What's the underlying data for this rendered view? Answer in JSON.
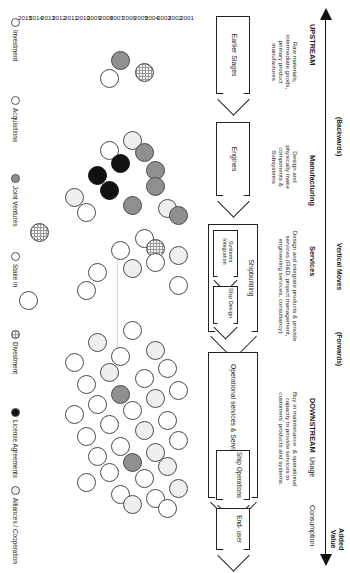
{
  "diagram": {
    "axis": {
      "left_end": "UPSTREAM",
      "left_direction": "(Backwards)",
      "right_end": "DOWNSTREAM",
      "right_direction": "(Forwards)",
      "center_label": "Vertical Moves",
      "added_value": "Added\nValue"
    },
    "stage_headers": [
      {
        "id": "manufacturing",
        "label": "Manufacturing"
      },
      {
        "id": "services",
        "label": "Services"
      },
      {
        "id": "usage",
        "label": "Usage"
      },
      {
        "id": "consumption",
        "label": "Consumption"
      }
    ],
    "descriptions": [
      {
        "id": "desc-upstream",
        "text": "Raw materials,\nintermediate goods,\nprimary product\nmanufactures"
      },
      {
        "id": "desc-manufacturing",
        "text": "Design and\nphysically make\ncomponents &\nSubsystems"
      },
      {
        "id": "desc-services",
        "text": "Design and integrate products & provide\nservices (R&D, project management,\nengineering services, consultancy)"
      },
      {
        "id": "desc-downstream",
        "text": "Buy in maintenance  & operational\ncapacity to provide services to\ncustomers' products and systems."
      }
    ],
    "chain_boxes": [
      {
        "id": "earlier-stages",
        "label": "Earlier Stages"
      },
      {
        "id": "engines",
        "label": "Engines"
      },
      {
        "id": "shipbuilding",
        "label": "Shipbuilding"
      },
      {
        "id": "systems-integration",
        "label": "Systems\nIntegration"
      },
      {
        "id": "ship-design",
        "label": "Ship\nDesign"
      },
      {
        "id": "operational-services",
        "label": "Operational services & Service provision"
      },
      {
        "id": "ship-operations",
        "label": "Ship\nOperations"
      },
      {
        "id": "end-user",
        "label": "End-\nuser"
      }
    ],
    "year_axis": {
      "label": "Year",
      "years": [
        "2001",
        "2002",
        "2003",
        "2004",
        "2005",
        "2006",
        "2007",
        "2008",
        "2009",
        "2010",
        "2011",
        "2012",
        "2013",
        "2014",
        "2015"
      ]
    },
    "legend": {
      "items": [
        {
          "id": "investment",
          "label": "Investment",
          "fill": "#ffffff",
          "style": "white"
        },
        {
          "id": "acquisitions",
          "label": "Acquisitions",
          "fill": "#ffffff",
          "style": "white"
        },
        {
          "id": "joint-ventures",
          "label": "Joint Ventures",
          "fill": "#8f8f8f",
          "style": "gray"
        },
        {
          "id": "stake-in",
          "label": "Stake in",
          "fill": "#ffffff",
          "style": "white"
        },
        {
          "id": "divestment",
          "label": "Divestment",
          "fill": "#f4f4f4",
          "style": "hatch"
        },
        {
          "id": "license-agreements",
          "label": "License Agreements",
          "fill": "#111111",
          "style": "black"
        },
        {
          "id": "alliances-cooperation",
          "label": "Alliances / Cooperation",
          "fill": "#efefef",
          "style": "light"
        }
      ]
    }
  },
  "chart_data": {
    "type": "scatter",
    "xlabel": "Value chain stage",
    "ylabel": "Year",
    "xlim": [
      0,
      573
    ],
    "ylim": [
      2001,
      2015
    ],
    "grid": false,
    "legend_position": "bottom",
    "categories": [
      "Earlier Stages",
      "Engines",
      "Systems Integration",
      "Shipbuilding",
      "Ship Design",
      "Operational services & Service provision",
      "Ship Operations",
      "End-user"
    ],
    "series": [
      {
        "name": "Investment",
        "style": "white"
      },
      {
        "name": "Acquisitions",
        "style": "white"
      },
      {
        "name": "Joint Ventures",
        "style": "gray"
      },
      {
        "name": "Stake in",
        "style": "white"
      },
      {
        "name": "Divestment",
        "style": "hatch"
      },
      {
        "name": "License Agreements",
        "style": "black"
      },
      {
        "name": "Alliances / Cooperation",
        "style": "light"
      }
    ],
    "points": [
      {
        "x": 60,
        "y": 2006,
        "style": "gray"
      },
      {
        "x": 72,
        "y": 2004,
        "style": "hatch"
      },
      {
        "x": 78,
        "y": 2007,
        "style": "white"
      },
      {
        "x": 140,
        "y": 2005,
        "style": "light"
      },
      {
        "x": 152,
        "y": 2004,
        "style": "gray"
      },
      {
        "x": 150,
        "y": 2007,
        "style": "white"
      },
      {
        "x": 163,
        "y": 2006,
        "style": "black"
      },
      {
        "x": 170,
        "y": 2003,
        "style": "gray"
      },
      {
        "x": 175,
        "y": 2008,
        "style": "black"
      },
      {
        "x": 186,
        "y": 2003,
        "style": "gray"
      },
      {
        "x": 190,
        "y": 2007,
        "style": "black"
      },
      {
        "x": 197,
        "y": 2010,
        "style": "light"
      },
      {
        "x": 205,
        "y": 2005,
        "style": "gray"
      },
      {
        "x": 208,
        "y": 2002,
        "style": "light"
      },
      {
        "x": 212,
        "y": 2009,
        "style": "white"
      },
      {
        "x": 232,
        "y": 2013,
        "style": "hatch"
      },
      {
        "x": 215,
        "y": 2001,
        "style": "gray"
      },
      {
        "x": 238,
        "y": 2004,
        "style": "white"
      },
      {
        "x": 248,
        "y": 2003,
        "style": "hatch"
      },
      {
        "x": 250,
        "y": 2006,
        "style": "white"
      },
      {
        "x": 255,
        "y": 2001,
        "style": "light"
      },
      {
        "x": 262,
        "y": 2003,
        "style": "white"
      },
      {
        "x": 268,
        "y": 2005,
        "style": "light"
      },
      {
        "x": 272,
        "y": 2008,
        "style": "white"
      },
      {
        "x": 285,
        "y": 2001,
        "style": "white"
      },
      {
        "x": 290,
        "y": 2009,
        "style": "white"
      },
      {
        "x": 300,
        "y": 2014,
        "style": "white"
      },
      {
        "x": 330,
        "y": 2005,
        "style": "white"
      },
      {
        "x": 342,
        "y": 2008,
        "style": "light"
      },
      {
        "x": 350,
        "y": 2003,
        "style": "light"
      },
      {
        "x": 356,
        "y": 2006,
        "style": "white"
      },
      {
        "x": 362,
        "y": 2010,
        "style": "white"
      },
      {
        "x": 368,
        "y": 2002,
        "style": "white"
      },
      {
        "x": 372,
        "y": 2007,
        "style": "light"
      },
      {
        "x": 378,
        "y": 2004,
        "style": "white"
      },
      {
        "x": 384,
        "y": 2009,
        "style": "white"
      },
      {
        "x": 390,
        "y": 2001,
        "style": "white"
      },
      {
        "x": 394,
        "y": 2006,
        "style": "gray"
      },
      {
        "x": 398,
        "y": 2003,
        "style": "light"
      },
      {
        "x": 404,
        "y": 2008,
        "style": "white"
      },
      {
        "x": 410,
        "y": 2005,
        "style": "white"
      },
      {
        "x": 414,
        "y": 2010,
        "style": "white"
      },
      {
        "x": 420,
        "y": 2002,
        "style": "white"
      },
      {
        "x": 424,
        "y": 2007,
        "style": "white"
      },
      {
        "x": 430,
        "y": 2004,
        "style": "light"
      },
      {
        "x": 436,
        "y": 2009,
        "style": "white"
      },
      {
        "x": 440,
        "y": 2001,
        "style": "white"
      },
      {
        "x": 446,
        "y": 2006,
        "style": "white"
      },
      {
        "x": 452,
        "y": 2003,
        "style": "light"
      },
      {
        "x": 456,
        "y": 2008,
        "style": "white"
      },
      {
        "x": 462,
        "y": 2005,
        "style": "gray"
      },
      {
        "x": 466,
        "y": 2002,
        "style": "light"
      },
      {
        "x": 472,
        "y": 2007,
        "style": "white"
      },
      {
        "x": 478,
        "y": 2004,
        "style": "white"
      },
      {
        "x": 482,
        "y": 2009,
        "style": "white"
      },
      {
        "x": 488,
        "y": 2001,
        "style": "light"
      },
      {
        "x": 494,
        "y": 2006,
        "style": "white"
      },
      {
        "x": 498,
        "y": 2003,
        "style": "white"
      },
      {
        "x": 504,
        "y": 2005,
        "style": "light"
      },
      {
        "x": 508,
        "y": 2002,
        "style": "white"
      }
    ]
  }
}
